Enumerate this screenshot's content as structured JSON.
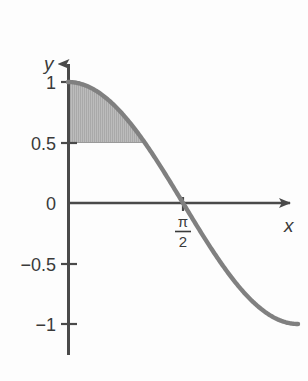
{
  "chart_data": {
    "type": "line",
    "title": "",
    "xlabel": "x",
    "ylabel": "y",
    "function": "y = cos(x)",
    "xlim": [
      0,
      3.1416
    ],
    "ylim": [
      -1,
      1
    ],
    "grid": false,
    "legend": null,
    "x_tick_labels": [
      "π/2"
    ],
    "x_tick_values": [
      1.5708
    ],
    "y_tick_labels": [
      "1",
      "0.5",
      "0",
      "−0.5",
      "−1"
    ],
    "y_tick_values": [
      1,
      0.5,
      0,
      -0.5,
      -1
    ],
    "series": [
      {
        "name": "cos(x)",
        "color": "#808080",
        "x": [
          0,
          0.1571,
          0.3142,
          0.4712,
          0.6283,
          0.7854,
          0.9425,
          1.0996,
          1.2566,
          1.4137,
          1.5708,
          1.7279,
          1.885,
          2.042,
          2.1991,
          2.3562,
          2.5133,
          2.6704,
          2.8274,
          2.9845,
          3.1416
        ],
        "y": [
          1.0,
          0.9877,
          0.9511,
          0.891,
          0.809,
          0.7071,
          0.5878,
          0.454,
          0.309,
          0.1564,
          0.0,
          -0.1564,
          -0.309,
          -0.454,
          -0.5878,
          -0.7071,
          -0.809,
          -0.891,
          -0.9511,
          -0.9877,
          -1.0
        ]
      }
    ],
    "shaded_region": {
      "label": "area between y=0.5 and y=cos(x)",
      "x_start": 0,
      "x_end": 1.0472,
      "y_lower": 0.5,
      "y_upper_curve": "cos(x)",
      "fill_color": "#b9b9b9"
    }
  },
  "labels": {
    "y_axis": "y",
    "x_axis": "x",
    "y_tick_1": "1",
    "y_tick_05": "0.5",
    "y_tick_0": "0",
    "y_tick_neg05": "−0.5",
    "y_tick_neg1": "−1",
    "x_tick_pi_numerator": "π",
    "x_tick_pi_denominator": "2"
  },
  "colors": {
    "background": "#fdfdfd",
    "axis": "#4a4a4a",
    "curve": "#808080",
    "shade": "#b9b9b9",
    "text": "#3a3a3a"
  }
}
